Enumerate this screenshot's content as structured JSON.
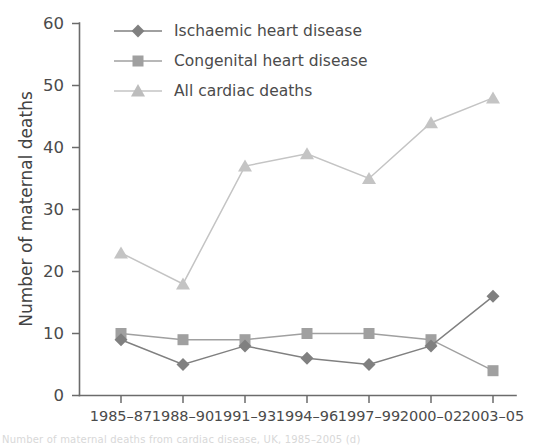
{
  "chart_data": {
    "type": "line",
    "title": "",
    "xlabel": "",
    "ylabel": "Number of maternal deaths",
    "categories": [
      "1985–87",
      "1988–90",
      "1991–93",
      "1994–96",
      "1997–99",
      "2000–02",
      "2003–05"
    ],
    "ylim": [
      0,
      60
    ],
    "yticks": [
      "0",
      "10",
      "20",
      "30",
      "40",
      "50",
      "60"
    ],
    "grid": false,
    "legend_position": "top-left-inside",
    "series": [
      {
        "name": "Ischaemic heart disease",
        "marker": "diamond",
        "color": "#808080",
        "values": [
          9,
          5,
          8,
          6,
          5,
          8,
          16
        ]
      },
      {
        "name": "Congenital heart disease",
        "marker": "square",
        "color": "#a0a0a0",
        "values": [
          10,
          9,
          9,
          10,
          10,
          9,
          4
        ]
      },
      {
        "name": "All cardiac deaths",
        "marker": "triangle",
        "color": "#c4c4c4",
        "values": [
          23,
          18,
          37,
          39,
          35,
          44,
          48
        ]
      }
    ]
  },
  "caption": {
    "text": "Number of maternal deaths from cardiac disease, UK, 1985–2005 (d)"
  },
  "colors": {
    "axis": "#6b6b6b",
    "text": "#4b4b4b",
    "background": "#ffffff"
  }
}
